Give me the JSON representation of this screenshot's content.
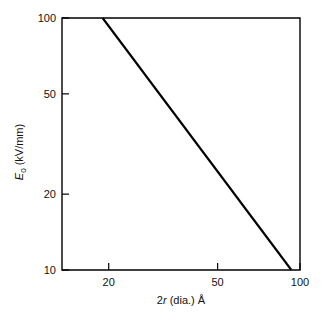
{
  "chart_data": {
    "type": "line",
    "title": "",
    "subtitle": "",
    "xlabel": "2r (dia.) Å",
    "ylabel": "E₀ (kV/mm)",
    "xscale": "log",
    "yscale": "log",
    "xlim": [
      13.5,
      100
    ],
    "ylim": [
      10,
      100
    ],
    "grid": false,
    "legend": null,
    "x_ticks": [
      {
        "value": 20,
        "label": "20"
      },
      {
        "value": 50,
        "label": "50"
      },
      {
        "value": 100,
        "label": "100"
      }
    ],
    "y_ticks": [
      {
        "value": 10,
        "label": "10"
      },
      {
        "value": 20,
        "label": "20"
      },
      {
        "value": 50,
        "label": "50"
      },
      {
        "value": 100,
        "label": "100"
      }
    ],
    "series": [
      {
        "name": "E0 vs diameter",
        "style": "solid",
        "color": "#000000",
        "x": [
          19,
          93
        ],
        "y": [
          100,
          10
        ],
        "points": [
          {
            "x": 19,
            "y": 100
          },
          {
            "x": 93,
            "y": 10
          }
        ]
      }
    ],
    "annotations": []
  },
  "axes": {
    "y_label_main": "E",
    "y_label_sub": "0",
    "y_label_unit": " (kV/mm)",
    "x_label_num": "2",
    "x_label_var": "r",
    "x_label_rest": " (dia.) Å"
  },
  "ticks": {
    "y": {
      "t100": "100",
      "t50": "50",
      "t20": "20",
      "t10": "10"
    },
    "x": {
      "t20": "20",
      "t50": "50",
      "t100": "100"
    }
  },
  "colors": {
    "line": "#000000",
    "frame": "#000000",
    "background": "#ffffff",
    "text": "#111111"
  }
}
